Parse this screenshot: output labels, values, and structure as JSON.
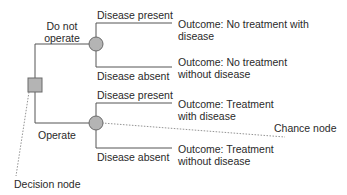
{
  "diagram": {
    "type": "decision-tree",
    "colors": {
      "line": "#555555",
      "node_fill": "#b4b4b4",
      "node_stroke": "#6a6a6a",
      "dotted": "#777777"
    },
    "decision_node": {
      "label": "Decision node"
    },
    "chance_node_annotation": {
      "label": "Chance node"
    },
    "branches": [
      {
        "label_line1": "Do not",
        "label_line2": "operate",
        "outcomes": [
          {
            "label": "Disease present",
            "outcome_line1": "Outcome: No treatment with",
            "outcome_line2": "disease"
          },
          {
            "label": "Disease absent",
            "outcome_line1": "Outcome: No treatment",
            "outcome_line2": "without disease"
          }
        ]
      },
      {
        "label_line1": "Operate",
        "outcomes": [
          {
            "label": "Disease present",
            "outcome_line1": "Outcome: Treatment",
            "outcome_line2": "with disease"
          },
          {
            "label": "Disease absent",
            "outcome_line1": "Outcome: Treatment",
            "outcome_line2": "without disease"
          }
        ]
      }
    ]
  }
}
